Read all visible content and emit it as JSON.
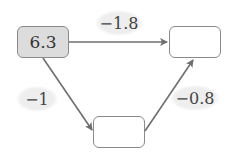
{
  "nodes": [
    {
      "id": "start",
      "value": "6.3",
      "filled": true
    },
    {
      "id": "end",
      "value": ""
    },
    {
      "id": "middle",
      "value": ""
    }
  ],
  "edges": [
    {
      "from": "start",
      "to": "end",
      "label": "−1.8"
    },
    {
      "from": "start",
      "to": "middle",
      "label": "−1"
    },
    {
      "from": "middle",
      "to": "end",
      "label": "−0.8"
    }
  ],
  "colors": {
    "arrow": "#6e6e6e",
    "border": "#8a8a8a",
    "filled_box": "#dcdcdc",
    "label_bg": "#eeeeee"
  }
}
